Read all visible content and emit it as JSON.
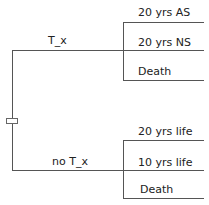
{
  "diagram": {
    "type": "decision-tree",
    "root": {
      "node_type": "decision",
      "icon": "square-decision-node"
    },
    "branches": [
      {
        "label": "T_x",
        "outcomes": [
          {
            "label": "20 yrs AS"
          },
          {
            "label": "20 yrs NS"
          },
          {
            "label": "Death"
          }
        ]
      },
      {
        "label": "no T_x",
        "outcomes": [
          {
            "label": "20 yrs life"
          },
          {
            "label": "10 yrs life"
          },
          {
            "label": "Death"
          }
        ]
      }
    ]
  }
}
